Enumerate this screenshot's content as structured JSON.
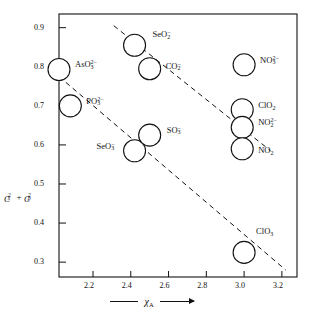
{
  "chart_data": {
    "type": "scatter",
    "title": "",
    "xlabel": "χA",
    "ylabel": "Cs² + Cp²",
    "xlim": [
      2.02,
      3.28
    ],
    "ylim": [
      0.262,
      0.935
    ],
    "grid": false,
    "legend": "none",
    "marker": "open-circle",
    "xticks": [
      "2.2",
      "2.4",
      "2.6",
      "2.8",
      "3.0",
      "3.2"
    ],
    "xtick_values": [
      2.2,
      2.4,
      2.6,
      2.8,
      3.0,
      3.2
    ],
    "yticks": [
      "0.9",
      "0.8",
      "0.7",
      "0.6",
      "0.5",
      "0.4",
      "0.3"
    ],
    "ytick_values": [
      0.9,
      0.8,
      0.7,
      0.6,
      0.5,
      0.4,
      0.3
    ],
    "points": [
      {
        "id": "aso3",
        "label": "AsO3 2-",
        "formula": "AsO",
        "sub": "3",
        "sup": "2−",
        "x": 2.02,
        "y": 0.793,
        "label_dx": 16,
        "label_dy": -4
      },
      {
        "id": "po3",
        "label": "PO3 2-",
        "formula": "PO",
        "sub": "3",
        "sup": "2−",
        "x": 2.08,
        "y": 0.7,
        "label_dx": 16,
        "label_dy": -4
      },
      {
        "id": "seo2",
        "label": "SeO2 -",
        "formula": "SeO",
        "sub": "2",
        "sup": "−",
        "x": 2.42,
        "y": 0.855,
        "label_dx": 18,
        "label_dy": -10
      },
      {
        "id": "co2",
        "label": "CO2 -",
        "formula": "CO",
        "sub": "2",
        "sup": "−",
        "x": 2.5,
        "y": 0.795,
        "label_dx": 16,
        "label_dy": -2
      },
      {
        "id": "seo3",
        "label": "SeO3 -",
        "formula": "SeO",
        "sub": "3",
        "sup": "−",
        "x": 2.42,
        "y": 0.585,
        "label_dx": -38,
        "label_dy": -4
      },
      {
        "id": "so3",
        "label": "SO3 -",
        "formula": "SO",
        "sub": "3",
        "sup": "−",
        "x": 2.5,
        "y": 0.625,
        "label_dx": 17,
        "label_dy": -4
      },
      {
        "id": "no3",
        "label": "NO3 2-",
        "formula": "NO",
        "sub": "3",
        "sup": "2−",
        "x": 3.0,
        "y": 0.805,
        "label_dx": 16,
        "label_dy": -4
      },
      {
        "id": "clo2",
        "label": "ClO2",
        "formula": "ClO",
        "sub": "2",
        "sup": "",
        "x": 2.99,
        "y": 0.69,
        "label_dx": 16,
        "label_dy": -4
      },
      {
        "id": "no2d",
        "label": "NO2 2-",
        "formula": "NO",
        "sub": "2",
        "sup": "2−",
        "x": 2.99,
        "y": 0.645,
        "label_dx": 16,
        "label_dy": -4
      },
      {
        "id": "no2",
        "label": "NO2",
        "formula": "NO",
        "sub": "2",
        "sup": "",
        "x": 2.99,
        "y": 0.59,
        "label_dx": 16,
        "label_dy": 2
      },
      {
        "id": "clo3",
        "label": "ClO3",
        "formula": "ClO",
        "sub": "3",
        "sup": "",
        "x": 3.0,
        "y": 0.325,
        "label_dx": 12,
        "label_dy": -20
      }
    ],
    "trend_lines": [
      {
        "id": "upper-series",
        "style": "dashed",
        "x1": 2.31,
        "y1": 0.905,
        "x2": 3.14,
        "y2": 0.585
      },
      {
        "id": "lower-series",
        "style": "dashed",
        "x1": 2.02,
        "y1": 0.775,
        "x2": 3.22,
        "y2": 0.28
      }
    ]
  }
}
